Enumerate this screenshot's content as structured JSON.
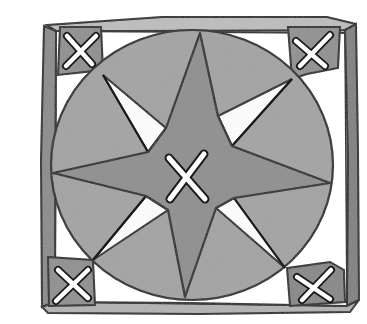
{
  "illustration": {
    "subject": "Hand-drawn compass rose tile",
    "description": "Square frame containing a gray circle with an eight-pointed star, an X mark at the center and X marks in each of the four corner squares",
    "colors": {
      "background": "#ffffff",
      "frame_fill": "#b9b9b9",
      "frame_dark": "#7a7a7a",
      "circle_fill": "#9a9a9a",
      "star_fill": "#8c8c8c",
      "minor_points_fill": "#a6a6a6",
      "corner_fill": "#8e8e8e",
      "ink": "#1a1a1a",
      "x_mark": "#ffffff"
    },
    "elements": {
      "frame": "square-frame",
      "circle": "gray-disc",
      "star_major_points": 4,
      "star_minor_points": 4,
      "center_mark": "x-mark",
      "corner_marks": [
        "top-left-x",
        "top-right-x",
        "bottom-left-x",
        "bottom-right-x"
      ]
    }
  }
}
